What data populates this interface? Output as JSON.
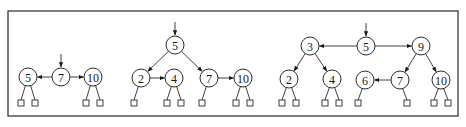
{
  "figure": {
    "panels": [
      {
        "id": "panel-1",
        "entry_node": "7",
        "nodes": [
          {
            "id": "p1-5",
            "label": "5",
            "leaves": 2
          },
          {
            "id": "p1-7",
            "label": "7",
            "leaves": 0
          },
          {
            "id": "p1-10",
            "label": "10",
            "leaves": 2
          }
        ],
        "edges": [
          {
            "from": "p1-7",
            "to": "p1-5",
            "arrow": true
          },
          {
            "from": "p1-7",
            "to": "p1-10",
            "arrow": true
          }
        ]
      },
      {
        "id": "panel-2",
        "entry_node": "5",
        "nodes": [
          {
            "id": "p2-5",
            "label": "5",
            "leaves": 0
          },
          {
            "id": "p2-2",
            "label": "2",
            "leaves": 1
          },
          {
            "id": "p2-4",
            "label": "4",
            "leaves": 2
          },
          {
            "id": "p2-7",
            "label": "7",
            "leaves": 1
          },
          {
            "id": "p2-10",
            "label": "10",
            "leaves": 2
          }
        ],
        "edges": [
          {
            "from": "p2-5",
            "to": "p2-2",
            "arrow": true
          },
          {
            "from": "p2-5",
            "to": "p2-7",
            "arrow": true
          },
          {
            "from": "p2-2",
            "to": "p2-4",
            "arrow": true
          },
          {
            "from": "p2-7",
            "to": "p2-10",
            "arrow": true
          }
        ]
      },
      {
        "id": "panel-3",
        "entry_node": "5",
        "nodes": [
          {
            "id": "p3-5",
            "label": "5",
            "leaves": 0
          },
          {
            "id": "p3-3",
            "label": "3",
            "leaves": 0
          },
          {
            "id": "p3-9",
            "label": "9",
            "leaves": 0
          },
          {
            "id": "p3-2",
            "label": "2",
            "leaves": 2
          },
          {
            "id": "p3-4",
            "label": "4",
            "leaves": 2
          },
          {
            "id": "p3-6",
            "label": "6",
            "leaves": 1
          },
          {
            "id": "p3-7",
            "label": "7",
            "leaves": 1
          },
          {
            "id": "p3-10",
            "label": "10",
            "leaves": 2
          }
        ],
        "edges": [
          {
            "from": "p3-5",
            "to": "p3-3",
            "arrow": true
          },
          {
            "from": "p3-5",
            "to": "p3-9",
            "arrow": true
          },
          {
            "from": "p3-3",
            "to": "p3-2",
            "arrow": true
          },
          {
            "from": "p3-3",
            "to": "p3-4",
            "arrow": true
          },
          {
            "from": "p3-9",
            "to": "p3-7",
            "arrow": true
          },
          {
            "from": "p3-9",
            "to": "p3-10",
            "arrow": true
          },
          {
            "from": "p3-7",
            "to": "p3-6",
            "arrow": true
          }
        ]
      }
    ]
  }
}
